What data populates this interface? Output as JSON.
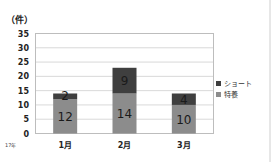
{
  "chart_data": {
    "type": "bar",
    "stacked": true,
    "title": "",
    "ylabel": "（件）",
    "xlabel": "",
    "x_annotation": "17年",
    "categories": [
      "1月",
      "2月",
      "3月"
    ],
    "series": [
      {
        "name": "特養",
        "values": [
          12,
          14,
          10
        ],
        "color": "#8c8c8c"
      },
      {
        "name": "ショート",
        "values": [
          2,
          9,
          4
        ],
        "color": "#3f3f3f"
      }
    ],
    "ylim": [
      0,
      35
    ],
    "yticks": [
      0,
      5,
      10,
      15,
      20,
      25,
      30,
      35
    ],
    "grid": true,
    "legend": {
      "position": "right",
      "entries": [
        "ショート",
        "特養"
      ]
    }
  }
}
